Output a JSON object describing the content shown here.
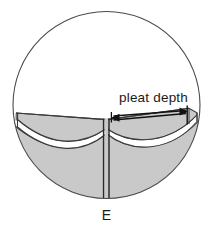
{
  "figure": {
    "type": "technical-line-drawing",
    "labels": {
      "pleat_depth": "pleat depth",
      "element_e": "E"
    },
    "colors": {
      "background": "#ffffff",
      "outline": "#3b3b3b",
      "fabric_fill": "#c9c9c9",
      "fabric_fill_shadow": "#bdbdbd",
      "void_fill": "#ffffff",
      "annotation": "#111111",
      "text": "#1a1a1a"
    },
    "geometry": {
      "circle": {
        "cx": 106.5,
        "cy": 105.0,
        "r": 93.5
      },
      "dimension_arrow": {
        "left_x": 112,
        "right_x": 186,
        "y": 116,
        "style": "double-headed"
      },
      "center_fold_x": 106.5,
      "center_fold_top_y": 117,
      "center_fold_bottom_y": 200
    }
  }
}
